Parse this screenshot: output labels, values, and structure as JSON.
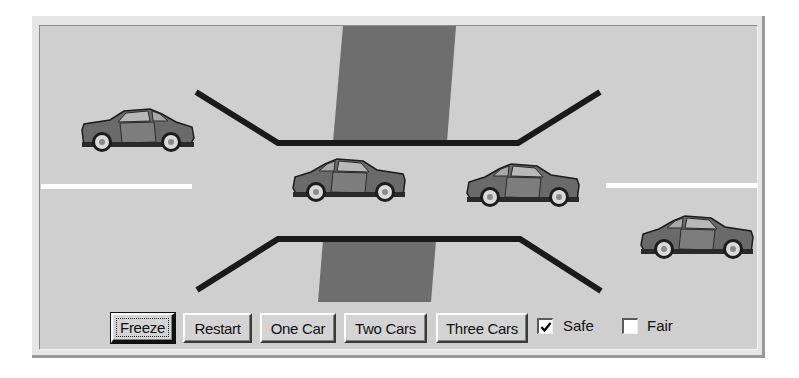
{
  "scene": {
    "background_color": "#cfcfcf",
    "crosswalk_color": "#6e6e6e",
    "wall_color": "#1a1a1a",
    "lane_marking_color": "#ffffff",
    "car_body_color": "#6a6a6a",
    "cars": [
      {
        "id": "car-1",
        "direction": "right",
        "x": 80,
        "y": 108
      },
      {
        "id": "car-2",
        "direction": "left",
        "x": 292,
        "y": 158
      },
      {
        "id": "car-3",
        "direction": "left",
        "x": 466,
        "y": 163
      },
      {
        "id": "car-4",
        "direction": "left",
        "x": 640,
        "y": 215
      }
    ]
  },
  "controls": {
    "buttons": [
      {
        "id": "freeze",
        "label": "Freeze",
        "focused": true
      },
      {
        "id": "restart",
        "label": "Restart",
        "focused": false
      },
      {
        "id": "one-car",
        "label": "One Car",
        "focused": false
      },
      {
        "id": "two-cars",
        "label": "Two Cars",
        "focused": false
      },
      {
        "id": "three-cars",
        "label": "Three Cars",
        "focused": false
      }
    ],
    "checkboxes": [
      {
        "id": "safe",
        "label": "Safe",
        "checked": true,
        "check_glyph": "✔"
      },
      {
        "id": "fair",
        "label": "Fair",
        "checked": false,
        "check_glyph": ""
      }
    ]
  }
}
